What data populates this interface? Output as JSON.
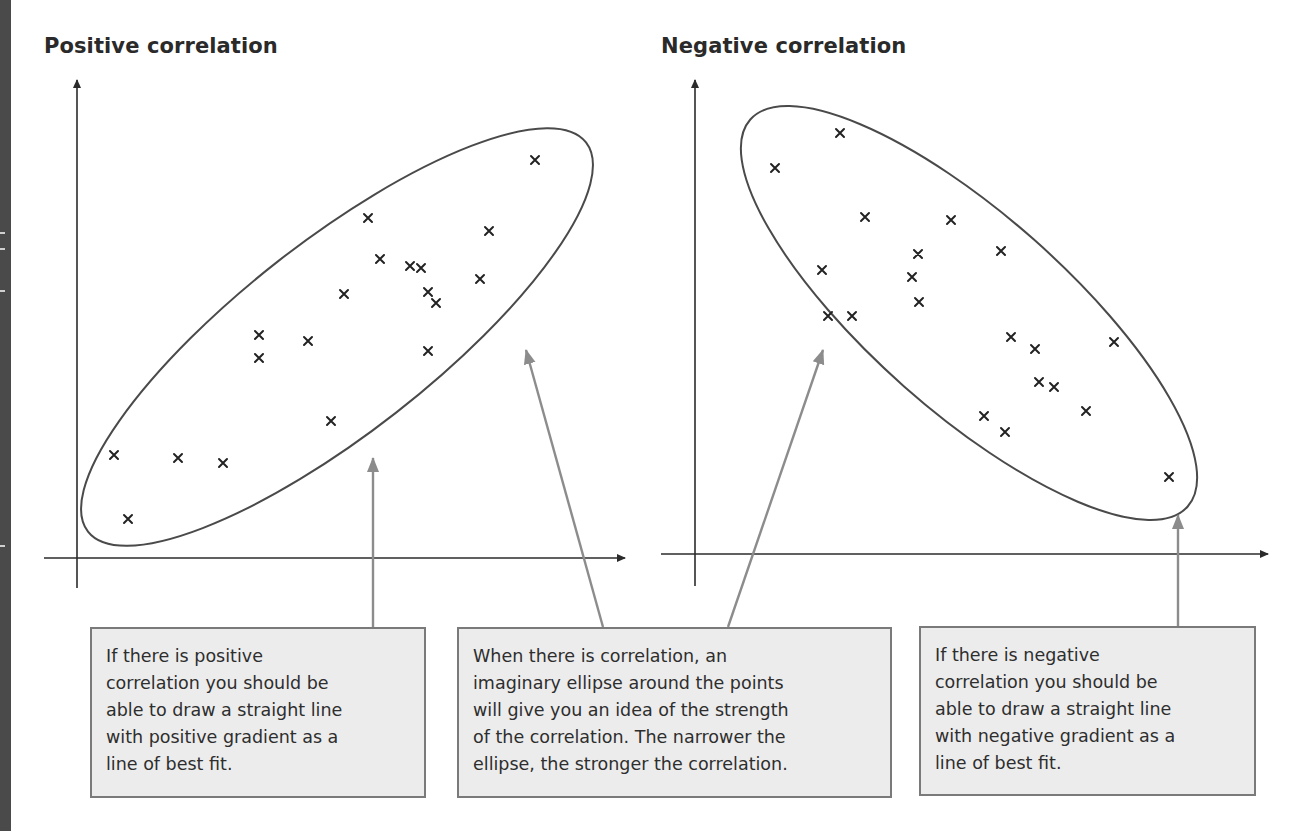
{
  "titles": {
    "positive": "Positive correlation",
    "negative": "Negative correlation"
  },
  "notes": {
    "positive": "If there is positive\ncorrelation you should be\nable to draw a straight line\nwith positive gradient as a\nline of best fit.",
    "middle": "When there is correlation, an\nimaginary ellipse around the points\nwill give you an idea of the strength\nof the correlation. The narrower the\nellipse, the stronger the correlation.",
    "negative": " If there is negative\ncorrelation you should be\nable to draw a straight line\nwith negative gradient as a\nline of best fit."
  },
  "colors": {
    "axis": "#2b2b2b",
    "ellipse": "#4a4a4a",
    "marker": "#222222",
    "callout_arrow": "#8c8c8c",
    "box_fill": "#ececec",
    "box_border": "#7a7a7a"
  },
  "chart_data": [
    {
      "type": "scatter",
      "title": "Positive correlation",
      "xlabel": "",
      "ylabel": "",
      "marker": "x",
      "grid": false,
      "annotation": "ellipse enclosing points, oriented up-right",
      "points_px": [
        [
          114,
          455
        ],
        [
          128,
          519
        ],
        [
          178,
          458
        ],
        [
          223,
          463
        ],
        [
          259,
          335
        ],
        [
          259,
          358
        ],
        [
          308,
          341
        ],
        [
          331,
          421
        ],
        [
          344,
          294
        ],
        [
          368,
          218
        ],
        [
          380,
          259
        ],
        [
          410,
          266
        ],
        [
          421,
          268
        ],
        [
          428,
          292
        ],
        [
          436,
          303
        ],
        [
          428,
          351
        ],
        [
          480,
          279
        ],
        [
          489,
          231
        ],
        [
          535,
          160
        ]
      ]
    },
    {
      "type": "scatter",
      "title": "Negative correlation",
      "xlabel": "",
      "ylabel": "",
      "marker": "x",
      "grid": false,
      "annotation": "ellipse enclosing points, oriented down-right",
      "points_px": [
        [
          775,
          168
        ],
        [
          840,
          133
        ],
        [
          865,
          217
        ],
        [
          822,
          270
        ],
        [
          828,
          316
        ],
        [
          852,
          316
        ],
        [
          918,
          254
        ],
        [
          912,
          277
        ],
        [
          919,
          302
        ],
        [
          951,
          220
        ],
        [
          1001,
          251
        ],
        [
          1011,
          337
        ],
        [
          1035,
          349
        ],
        [
          1039,
          382
        ],
        [
          1054,
          387
        ],
        [
          984,
          416
        ],
        [
          1005,
          432
        ],
        [
          1086,
          411
        ],
        [
          1114,
          342
        ],
        [
          1169,
          477
        ]
      ]
    }
  ]
}
